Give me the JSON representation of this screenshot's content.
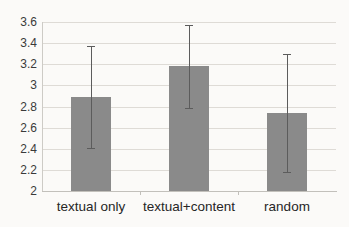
{
  "chart_data": {
    "type": "bar",
    "title": "",
    "xlabel": "",
    "ylabel": "",
    "categories": [
      "textual only",
      "textual+content",
      "random"
    ],
    "values": [
      2.89,
      3.18,
      2.74
    ],
    "errors": [
      0.48,
      0.39,
      0.56
    ],
    "ylim": [
      2,
      3.6
    ],
    "ytick_step": 0.2,
    "ytick_labels": [
      "2",
      "2.2",
      "2.4",
      "2.6",
      "2.8",
      "3",
      "3.2",
      "3.4",
      "3.6"
    ],
    "grid": "horizontal",
    "legend": "none",
    "colors": {
      "bar_fill": "#8a8a8a",
      "error_bar": "#5c5c5c",
      "gridline": "#dedbd6",
      "axis_line": "#c2c0bb",
      "background": "#fbfaf8",
      "tick_text": "#3a3a3a",
      "category_text": "#262626"
    }
  }
}
